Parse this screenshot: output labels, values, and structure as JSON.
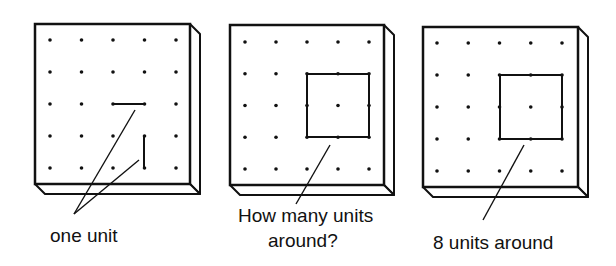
{
  "figure": {
    "panels": [
      {
        "id": "panel-one-unit",
        "board": {
          "x": 35,
          "y": 24,
          "w": 155,
          "h": 160,
          "depth": 10
        },
        "grid": {
          "x0": 50,
          "y0": 40,
          "dx": 31.5,
          "dy": 32,
          "n": 5
        },
        "segments": [
          {
            "x1": 113,
            "y1": 104,
            "x2": 144,
            "y2": 104
          },
          {
            "x1": 144,
            "y1": 136,
            "x2": 144,
            "y2": 168
          }
        ],
        "pointers": [
          {
            "x1": 135,
            "y1": 110,
            "x2": 74,
            "y2": 214
          },
          {
            "x1": 139,
            "y1": 160,
            "x2": 74,
            "y2": 214
          }
        ],
        "labels": [
          {
            "text": "one unit",
            "x": 50,
            "y": 242
          }
        ]
      },
      {
        "id": "panel-how-many",
        "board": {
          "x": 230,
          "y": 25,
          "w": 154,
          "h": 160,
          "depth": 10
        },
        "grid": {
          "x0": 245,
          "y0": 42,
          "dx": 31,
          "dy": 31.75,
          "n": 5
        },
        "square": {
          "x": 307,
          "y": 74,
          "w": 62,
          "h": 63
        },
        "pointers": [
          {
            "x1": 330,
            "y1": 145,
            "x2": 296,
            "y2": 204
          }
        ],
        "labels": [
          {
            "text": "How many units",
            "x": 238,
            "y": 222
          },
          {
            "text": "around?",
            "x": 268,
            "y": 247
          }
        ]
      },
      {
        "id": "panel-eight-units",
        "board": {
          "x": 423,
          "y": 27,
          "w": 155,
          "h": 160,
          "depth": 10
        },
        "grid": {
          "x0": 437,
          "y0": 43,
          "dx": 31.25,
          "dy": 32,
          "n": 5
        },
        "square": {
          "x": 500,
          "y": 75,
          "w": 62,
          "h": 64
        },
        "pointers": [
          {
            "x1": 524,
            "y1": 145,
            "x2": 483,
            "y2": 220
          }
        ],
        "labels": [
          {
            "text": "8 units around",
            "x": 433,
            "y": 249
          }
        ]
      }
    ],
    "colors": {
      "ink": "#111111",
      "paper": "#ffffff"
    }
  }
}
